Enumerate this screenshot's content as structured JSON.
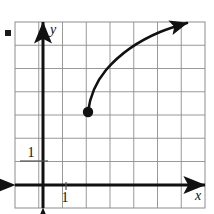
{
  "figure": {
    "name": "cartesian-grid-log-curve",
    "bullet_marker": {
      "name": "item-bullet",
      "x": 5,
      "y": 30,
      "size": 6,
      "color": "#1a1a1a"
    },
    "grid": {
      "left": 15,
      "top": 22,
      "right": 205,
      "bottom": 208,
      "cell": 23.75,
      "cols": 8,
      "rows": 8,
      "line_color": "#8d8d8d",
      "border_color": "#8d8d8d",
      "show_grid": true
    },
    "axes": {
      "x_axis": {
        "name": "x-axis",
        "y": 185,
        "x_start": 15,
        "x_end": 205,
        "arrow_left": true,
        "arrow_right": true,
        "color": "#111111",
        "width": 3
      },
      "y_axis": {
        "name": "y-axis",
        "x": 43,
        "y_start": 22,
        "y_end": 208,
        "arrow_up": true,
        "arrow_down": true,
        "color": "#111111",
        "width": 3
      },
      "x_axis_label": {
        "text": "x",
        "x": 198,
        "y": 200
      },
      "y_axis_label": {
        "text": "y",
        "x": 53,
        "y": 34
      }
    },
    "ticks": [
      {
        "name": "tick-label-y-one",
        "text": "1",
        "axis": "y",
        "value": 1,
        "label_x": 31,
        "label_y": 157,
        "mark_x1": 20,
        "mark_x2": 48,
        "mark_y": 161
      },
      {
        "name": "tick-label-x-one",
        "text": "1",
        "axis": "x",
        "value": 1,
        "label_x": 65,
        "label_y": 202,
        "mark_x": 66,
        "mark_y1": 182,
        "mark_y2": 190
      }
    ],
    "curve": {
      "name": "logarithmic-curve",
      "type": "logarithmic",
      "color": "#111111",
      "stroke_width": 2.6,
      "endpoint_dot": {
        "name": "closed-endpoint-dot",
        "x": 88,
        "y": 112,
        "r": 5.2,
        "filled": true
      },
      "arrow_head": {
        "x": 188,
        "y": 23
      },
      "path": "M 88,112 C 90,96 96,82 106,70 C 118,56 136,42 160,32 C 170,28 180,25 187,23",
      "points": [
        {
          "x": 88,
          "y": 112
        },
        {
          "x": 95,
          "y": 92
        },
        {
          "x": 104,
          "y": 75
        },
        {
          "x": 118,
          "y": 60
        },
        {
          "x": 136,
          "y": 47
        },
        {
          "x": 158,
          "y": 34
        },
        {
          "x": 188,
          "y": 23
        }
      ]
    }
  },
  "chart_data": {
    "type": "line",
    "title": "",
    "xlabel": "x",
    "ylabel": "y",
    "grid": true,
    "legend": null,
    "xlim": [
      -1,
      7
    ],
    "ylim": [
      -1,
      7
    ],
    "xticks": [
      1
    ],
    "yticks": [
      1
    ],
    "xticklabels": [
      "1"
    ],
    "yticklabels": [
      "1"
    ],
    "series": [
      {
        "name": "logarithmic-curve",
        "style": "solid",
        "color": "#111111",
        "start_marker": "filled-circle",
        "end_marker": "arrow",
        "x": [
          2.0,
          2.3,
          2.7,
          3.3,
          4.1,
          5.0,
          6.3
        ],
        "y": [
          3.0,
          3.9,
          4.6,
          5.3,
          5.8,
          6.4,
          6.9
        ]
      }
    ],
    "annotations": [
      {
        "text": "closed point at start of curve",
        "x": 2.0,
        "y": 3.0
      }
    ]
  }
}
